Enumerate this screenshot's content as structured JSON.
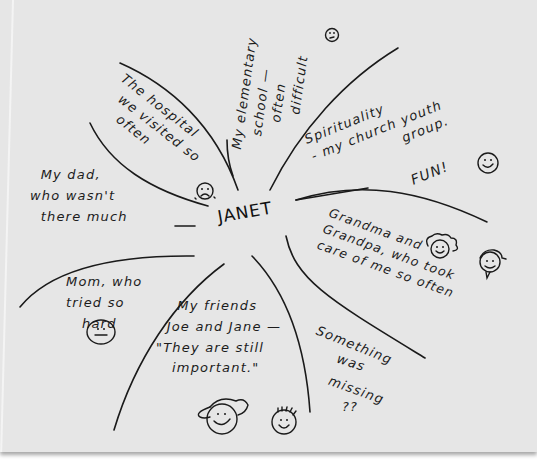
{
  "diagram": {
    "type": "ecomap",
    "style": "hand-drawn",
    "center": {
      "label": "JANET"
    },
    "sections": [
      {
        "id": "hospital",
        "lines": [
          "The hospital",
          "we visited so",
          "often"
        ],
        "emoji": "sad-face"
      },
      {
        "id": "school",
        "lines": [
          "My elementary",
          "school —",
          "often",
          "difficult"
        ],
        "emoji": "worried-face"
      },
      {
        "id": "spirituality",
        "lines": [
          "Spirituality",
          "- my church youth",
          "group.",
          "FUN!"
        ],
        "emoji": "smiley-face"
      },
      {
        "id": "grandparents",
        "lines": [
          "Grandma and",
          "Grandpa, who took",
          "care of me so often"
        ],
        "emoji": [
          "grandma-face",
          "grandpa-face"
        ]
      },
      {
        "id": "missing",
        "lines": [
          "Something",
          "was",
          "missing",
          "??"
        ]
      },
      {
        "id": "friends",
        "lines": [
          "My friends",
          "Joe and Jane —",
          "\"They are still",
          "important.\""
        ],
        "emoji": [
          "jane-face",
          "joe-face"
        ]
      },
      {
        "id": "mom",
        "lines": [
          "Mom, who",
          "tried so",
          "hard"
        ],
        "emoji": "neutral-face"
      },
      {
        "id": "dad",
        "lines": [
          "My dad,",
          "who wasn't",
          "there much"
        ]
      }
    ]
  },
  "text": {
    "center": "JANET",
    "hospital": "The hospital\n  we visited so\n    often",
    "school": "My elementary\n   school —\n      often\n        difficult",
    "spirituality": "Spirituality\n- my church youth\n                 group.",
    "fun": "FUN!",
    "grandparents": "Grandma and\nGrandpa, who took\ncare of me so often",
    "missing1": "Something",
    "missing2": "was",
    "missing3": "missing",
    "missing4": "??",
    "friends": "    My friends\n  Joe and Jane —\n\"They are still\n   important.\"",
    "mom": "Mom, who\ntried so\n   hard",
    "dad": "  My dad,\nwho wasn't\n  there much"
  },
  "colors": {
    "paper": "#e6e6e6",
    "ink": "#1a1a1a",
    "background": "#ffffff"
  }
}
